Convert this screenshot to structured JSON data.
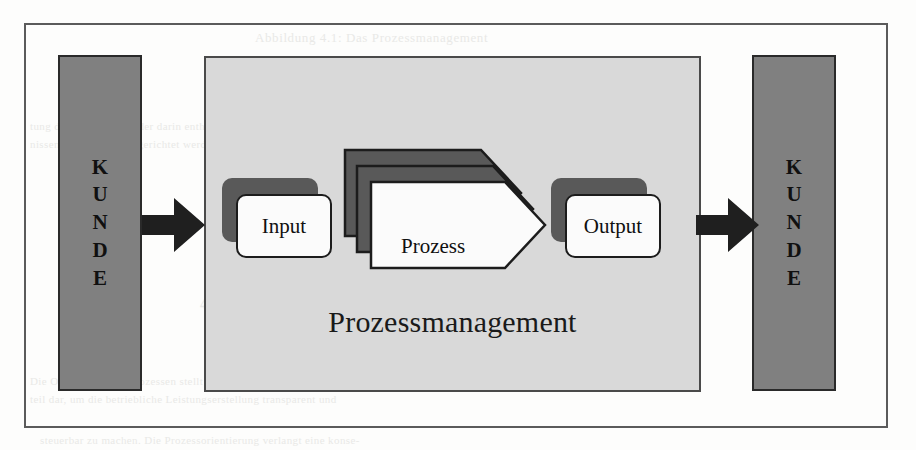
{
  "diagram": {
    "title": "Prozessmanagement",
    "customer_left": {
      "label": "KUNDE",
      "letters": [
        "K",
        "U",
        "N",
        "D",
        "E"
      ]
    },
    "customer_right": {
      "label": "KUNDE",
      "letters": [
        "K",
        "U",
        "N",
        "D",
        "E"
      ]
    },
    "nodes": {
      "input": "Input",
      "process": "Prozess",
      "output": "Output"
    },
    "arrows": {
      "inbound": "arrow-right",
      "outbound": "arrow-right"
    },
    "colors": {
      "customer_bar_fill": "#808080",
      "panel_fill": "#d9d9d9",
      "card_shadow_fill": "#595959",
      "card_fill": "#fbfbfb",
      "chevron_back_fill": "#595959",
      "chevron_front_fill": "#fbfbfb",
      "stroke": "#1c1c1c",
      "frame_stroke": "#5b5b5b",
      "page_background": "#fdfdfc"
    }
  },
  "bleedthrough": {
    "top": "Abbildung 4.1: Das Prozessmanagement",
    "upper_line1": "tung der Prozesse und der darin enthaltenen Aktivitaeten an den",
    "upper_line2": "nissen der Kunden ausgerichtet werden muessen.",
    "middle_heading": "4.1.1   Die Bedeutung der Prozessorientierung",
    "lower_line1": "Die Orientierung an Prozessen stellt einen wesentlichen Bestand-",
    "lower_line2": "teil dar, um die betriebliche Leistungserstellung transparent und",
    "bottom": "steuerbar zu machen. Die Prozessorientierung verlangt eine konse-"
  }
}
